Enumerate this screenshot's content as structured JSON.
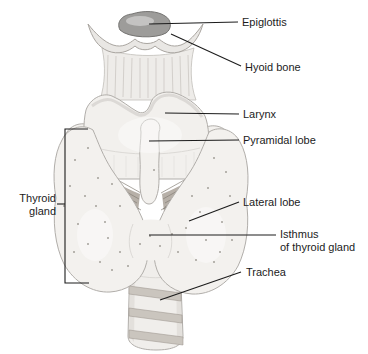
{
  "figure": {
    "labels": {
      "epiglottis": "Epiglottis",
      "hyoid_bone": "Hyoid bone",
      "larynx": "Larynx",
      "pyramidal_lobe": "Pyramidal lobe",
      "lateral_lobe": "Lateral lobe",
      "isthmus_line1": "Isthmus",
      "isthmus_line2": "of thyroid gland",
      "trachea": "Trachea",
      "thyroid_gland_line1": "Thyroid",
      "thyroid_gland_line2": "gland"
    },
    "colors": {
      "background": "#ffffff",
      "text": "#1c1c1c",
      "leader_line": "#1c1c1c",
      "cartilage_fill": "#f2f0ed",
      "gland_fill": "#f3f1ee",
      "membrane_fill": "#eeece9",
      "outline": "#b1aeaa",
      "epiglottis_fill": "#9d9c9a",
      "muscle_fill": "#b7b0a8",
      "muscle_striation": "#837c74",
      "trachea_band": "#cac5be",
      "stipple": "#8a847d"
    }
  }
}
